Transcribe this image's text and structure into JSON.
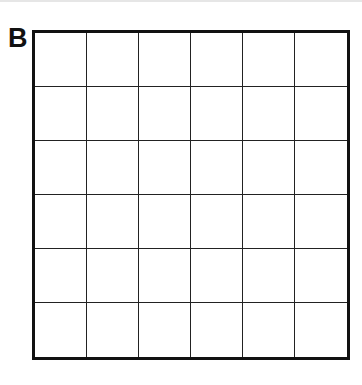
{
  "figure": {
    "label": "B",
    "grid": {
      "rows": 6,
      "columns": 6,
      "cells_empty": true
    },
    "colors": {
      "line": "#111111",
      "background": "#ffffff"
    }
  }
}
